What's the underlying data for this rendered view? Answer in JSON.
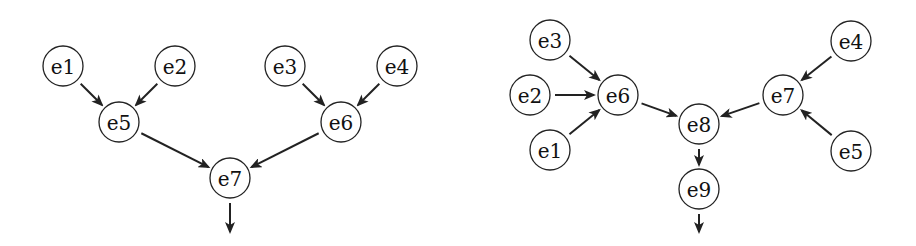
{
  "style": {
    "stroke_color": "#222222",
    "node_fill": "#ffffff",
    "node_radius": 20
  },
  "diagrams": [
    {
      "name": "left-tree",
      "nodes": [
        {
          "id": "e1",
          "label": "e1",
          "x": 63,
          "y": 66
        },
        {
          "id": "e2",
          "label": "e2",
          "x": 175,
          "y": 66
        },
        {
          "id": "e3",
          "label": "e3",
          "x": 285,
          "y": 66
        },
        {
          "id": "e4",
          "label": "e4",
          "x": 397,
          "y": 66
        },
        {
          "id": "e5",
          "label": "e5",
          "x": 119,
          "y": 122
        },
        {
          "id": "e6",
          "label": "e6",
          "x": 341,
          "y": 122
        },
        {
          "id": "e7",
          "label": "e7",
          "x": 230,
          "y": 178
        }
      ],
      "edges": [
        {
          "from": "e1",
          "to": "e5"
        },
        {
          "from": "e2",
          "to": "e5"
        },
        {
          "from": "e3",
          "to": "e6"
        },
        {
          "from": "e4",
          "to": "e6"
        },
        {
          "from": "e5",
          "to": "e7"
        },
        {
          "from": "e6",
          "to": "e7"
        },
        {
          "from": "e7",
          "to_point": [
            230,
            232
          ]
        }
      ]
    },
    {
      "name": "right-tree",
      "nodes": [
        {
          "id": "e3",
          "label": "e3",
          "x": 550,
          "y": 40
        },
        {
          "id": "e2",
          "label": "e2",
          "x": 530,
          "y": 95
        },
        {
          "id": "e1",
          "label": "e1",
          "x": 550,
          "y": 150
        },
        {
          "id": "e6",
          "label": "e6",
          "x": 618,
          "y": 95
        },
        {
          "id": "e8",
          "label": "e8",
          "x": 699,
          "y": 124
        },
        {
          "id": "e9",
          "label": "e9",
          "x": 699,
          "y": 189
        },
        {
          "id": "e7",
          "label": "e7",
          "x": 783,
          "y": 95
        },
        {
          "id": "e4",
          "label": "e4",
          "x": 851,
          "y": 41
        },
        {
          "id": "e5",
          "label": "e5",
          "x": 851,
          "y": 151
        }
      ],
      "edges": [
        {
          "from": "e3",
          "to": "e6"
        },
        {
          "from": "e2",
          "to": "e6"
        },
        {
          "from": "e1",
          "to": "e6"
        },
        {
          "from": "e6",
          "to": "e8"
        },
        {
          "from": "e7",
          "to": "e8"
        },
        {
          "from": "e4",
          "to": "e7"
        },
        {
          "from": "e5",
          "to": "e7"
        },
        {
          "from": "e8",
          "to": "e9"
        },
        {
          "from": "e9",
          "to_point": [
            699,
            232
          ]
        }
      ]
    }
  ]
}
